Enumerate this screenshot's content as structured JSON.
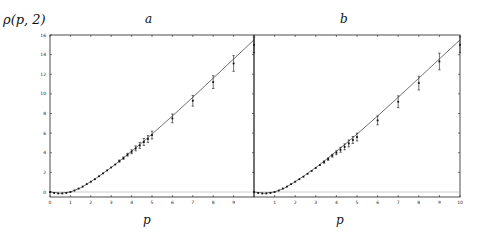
{
  "figure": {
    "ylabel": "ρ(p, 2)",
    "colors": {
      "axis": "#222222",
      "line": "#333333",
      "points": "#111111",
      "zero_line": "#999999"
    }
  },
  "chart_data": [
    {
      "type": "scatter",
      "panel": "a",
      "title": "a",
      "xlabel": "p",
      "ylabel": "ρ(p, 2)",
      "xlim": [
        0,
        10
      ],
      "ylim": [
        -0.5,
        16
      ],
      "xticks": [
        0,
        1,
        2,
        3,
        4,
        5,
        6,
        7,
        8,
        9
      ],
      "yticks": [
        0,
        2,
        4,
        6,
        8,
        10,
        12,
        14,
        16
      ],
      "grid": false,
      "series": [
        {
          "name": "data",
          "x": [
            0.0,
            0.2,
            0.4,
            0.6,
            0.8,
            1.0,
            1.2,
            1.4,
            1.6,
            1.8,
            2.0,
            2.2,
            2.4,
            2.6,
            2.8,
            3.0,
            3.2,
            3.4,
            3.6,
            3.8,
            4.0,
            4.2,
            4.4,
            4.6,
            4.8,
            5.0,
            6.0,
            7.0,
            8.0,
            9.0,
            10.0
          ],
          "y": [
            0.0,
            -0.1,
            -0.15,
            -0.15,
            -0.1,
            0.0,
            0.15,
            0.35,
            0.55,
            0.8,
            1.05,
            1.3,
            1.6,
            1.9,
            2.2,
            2.5,
            2.8,
            3.15,
            3.45,
            3.8,
            4.1,
            4.45,
            4.75,
            5.1,
            5.4,
            5.8,
            7.5,
            9.3,
            11.2,
            13.1,
            15.0
          ],
          "err": [
            0.03,
            0.03,
            0.03,
            0.03,
            0.03,
            0.03,
            0.04,
            0.04,
            0.05,
            0.05,
            0.06,
            0.06,
            0.07,
            0.07,
            0.08,
            0.09,
            0.1,
            0.11,
            0.12,
            0.14,
            0.2,
            0.25,
            0.3,
            0.35,
            0.35,
            0.4,
            0.45,
            0.55,
            0.65,
            0.8,
            0.8
          ]
        },
        {
          "name": "fit",
          "x": [
            0,
            0.5,
            1,
            1.5,
            2,
            2.5,
            3,
            3.5,
            4,
            4.5,
            5,
            6,
            7,
            8,
            9,
            10
          ],
          "y": [
            0.0,
            -0.12,
            0.0,
            0.42,
            1.05,
            1.75,
            2.5,
            3.3,
            4.15,
            5.0,
            5.9,
            7.75,
            9.65,
            11.6,
            13.55,
            15.5
          ]
        }
      ]
    },
    {
      "type": "scatter",
      "panel": "b",
      "title": "b",
      "xlabel": "p",
      "ylabel": "",
      "xlim": [
        0,
        10
      ],
      "ylim": [
        -0.5,
        16
      ],
      "xticks": [
        1,
        2,
        3,
        4,
        5,
        6,
        7,
        8,
        9,
        10
      ],
      "yticks": [],
      "grid": false,
      "series": [
        {
          "name": "data",
          "x": [
            0.0,
            0.2,
            0.4,
            0.6,
            0.8,
            1.0,
            1.2,
            1.4,
            1.6,
            1.8,
            2.0,
            2.2,
            2.4,
            2.6,
            2.8,
            3.0,
            3.2,
            3.4,
            3.6,
            3.8,
            4.0,
            4.2,
            4.4,
            4.6,
            4.8,
            5.0,
            6.0,
            7.0,
            8.0,
            9.0,
            10.0
          ],
          "y": [
            0.0,
            -0.1,
            -0.15,
            -0.15,
            -0.1,
            0.0,
            0.15,
            0.35,
            0.55,
            0.8,
            1.05,
            1.3,
            1.55,
            1.85,
            2.15,
            2.45,
            2.75,
            3.05,
            3.35,
            3.7,
            4.0,
            4.3,
            4.6,
            4.95,
            5.3,
            5.6,
            7.3,
            9.2,
            11.1,
            13.3,
            15.0
          ],
          "err": [
            0.03,
            0.03,
            0.03,
            0.03,
            0.03,
            0.03,
            0.04,
            0.04,
            0.05,
            0.05,
            0.06,
            0.06,
            0.07,
            0.07,
            0.08,
            0.09,
            0.1,
            0.11,
            0.12,
            0.14,
            0.2,
            0.25,
            0.3,
            0.35,
            0.35,
            0.4,
            0.45,
            0.6,
            0.7,
            0.85,
            0.8
          ]
        },
        {
          "name": "fit",
          "x": [
            0,
            0.5,
            1,
            1.5,
            2,
            2.5,
            3,
            3.5,
            4,
            4.5,
            5,
            6,
            7,
            8,
            9,
            10
          ],
          "y": [
            0.0,
            -0.12,
            0.0,
            0.42,
            1.05,
            1.75,
            2.5,
            3.3,
            4.15,
            5.0,
            5.9,
            7.75,
            9.65,
            11.6,
            13.55,
            15.5
          ]
        }
      ]
    }
  ]
}
